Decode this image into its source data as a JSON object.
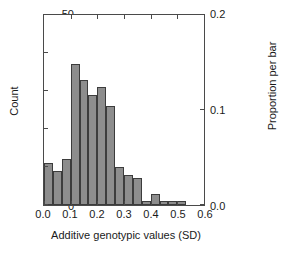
{
  "chart_data": {
    "type": "bar",
    "title": "",
    "subtitle": "",
    "xlabel": "Additive genotypic values (SD)",
    "ylabel": "Count",
    "ylabel_secondary": "Proportion per bar",
    "xlim": [
      0.0,
      0.6
    ],
    "ylim": [
      0,
      50
    ],
    "ylim_secondary": [
      0.0,
      0.2
    ],
    "grid": false,
    "legend": "none",
    "bin_width": 0.0333,
    "total_count": 210,
    "xticks": [
      "0.0",
      "0.1",
      "0.2",
      "0.3",
      "0.4",
      "0.5",
      "0.6"
    ],
    "xtick_values": [
      0.0,
      0.1,
      0.2,
      0.3,
      0.4,
      0.5,
      0.6
    ],
    "yticks": [
      "0",
      "10",
      "20",
      "30",
      "40",
      "50"
    ],
    "ytick_values": [
      0,
      10,
      20,
      30,
      40,
      50
    ],
    "yticks_secondary": [
      "0.0",
      "0.1",
      "0.2"
    ],
    "ytick_values_secondary": [
      0.0,
      0.1,
      0.2
    ],
    "bar_color": "#8d8d8d",
    "bar_edge_color": "#3c3c3c",
    "axis_color": "#4a4a4a",
    "bin_starts": [
      0.0,
      0.0333,
      0.0667,
      0.1,
      0.1333,
      0.1667,
      0.2,
      0.2333,
      0.2667,
      0.3,
      0.3333,
      0.3667,
      0.4,
      0.4333,
      0.4667,
      0.5
    ],
    "bin_ends": [
      0.0333,
      0.0667,
      0.1,
      0.1333,
      0.1667,
      0.2,
      0.2333,
      0.2667,
      0.3,
      0.3333,
      0.3667,
      0.4,
      0.4333,
      0.4667,
      0.5,
      0.5333
    ],
    "categories": [
      "0.000-0.033",
      "0.033-0.067",
      "0.067-0.100",
      "0.100-0.133",
      "0.133-0.167",
      "0.167-0.200",
      "0.200-0.233",
      "0.233-0.267",
      "0.267-0.300",
      "0.300-0.333",
      "0.333-0.367",
      "0.367-0.400",
      "0.400-0.433",
      "0.433-0.467",
      "0.467-0.500",
      "0.500-0.533"
    ],
    "values": [
      11,
      9,
      12,
      37,
      33,
      29,
      31,
      26,
      10,
      8,
      7,
      1,
      3,
      1,
      1,
      1
    ],
    "values_proportion": [
      0.052,
      0.043,
      0.057,
      0.176,
      0.157,
      0.138,
      0.148,
      0.124,
      0.048,
      0.038,
      0.033,
      0.005,
      0.014,
      0.005,
      0.005,
      0.005
    ]
  }
}
